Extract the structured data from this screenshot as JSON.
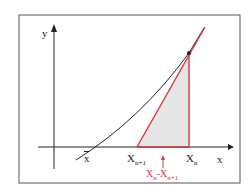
{
  "diagram": {
    "labels": {
      "y_axis": "y",
      "x_axis": "x",
      "root": "x̄",
      "xn1_base": "X",
      "xn1_sub": "n+1",
      "xn_base": "X",
      "xn_sub": "n",
      "diff_a": "X",
      "diff_a_sub": "n",
      "diff_mid": "-X",
      "diff_b_sub": "n+1"
    },
    "colors": {
      "curve": "#222222",
      "tangent": "#d9363e",
      "fill": "#e6e6e6",
      "frame": "#555555"
    }
  }
}
